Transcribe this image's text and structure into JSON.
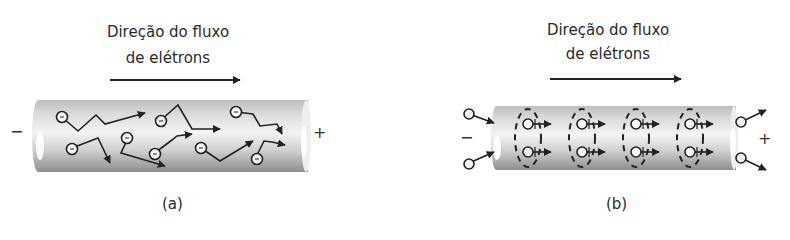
{
  "panels": {
    "a": {
      "title_line1": "Direção do fluxo",
      "title_line2": "de elétrons",
      "caption": "(a)",
      "negative_sign": "−",
      "positive_sign": "+",
      "description": "Random electron motion in a conductor with applied voltage"
    },
    "b": {
      "title_line1": "Direção do fluxo",
      "title_line2": "de elétrons",
      "caption": "(b)",
      "negative_sign": "−",
      "positive_sign": "+",
      "description": "Electrons drifting in orderly flow along the conductor"
    }
  },
  "colors": {
    "ink": "#222222",
    "cylinder_light": "#f2f2f2",
    "cylinder_dark": "#9a9a9a"
  }
}
